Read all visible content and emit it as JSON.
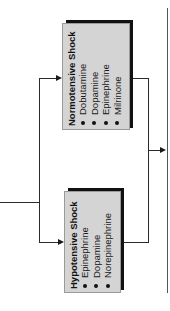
{
  "diagram": {
    "colors": {
      "box_fill": "#d4d4d4",
      "box_shadow": "#111111",
      "line": "#2a2a2a"
    },
    "boxes": [
      {
        "id": "normotensive",
        "title": "Normotensive Shock",
        "items": [
          "Dobutamine",
          "Dopamine",
          "Epinephrine",
          "Milrinone"
        ]
      },
      {
        "id": "hypotensive",
        "title": "Hypotensive Shock",
        "items": [
          "Epinephrine",
          "Dopamine",
          "Norepinephrine"
        ]
      }
    ]
  }
}
